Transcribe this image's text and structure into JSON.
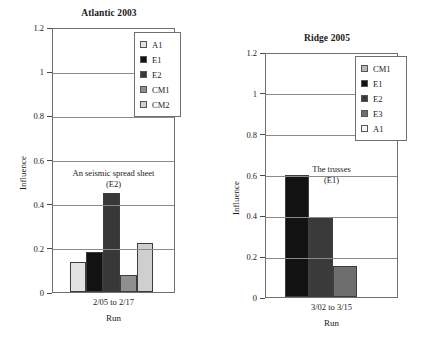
{
  "chart_data": [
    {
      "type": "bar",
      "title": "Atlantic 2003",
      "xlabel": "Run",
      "ylabel": "Influence",
      "categories": [
        "2/05 to 2/17"
      ],
      "ylim": [
        0,
        1.2
      ],
      "yticks": [
        "0",
        "0.2",
        "0.4",
        "0.6",
        "0.8",
        "1",
        "1.2"
      ],
      "ytick_values": [
        0,
        0.2,
        0.4,
        0.6,
        0.8,
        1,
        1.2
      ],
      "grid": true,
      "legend_position": "top-right",
      "series": [
        {
          "name": "A1",
          "values": [
            0.135
          ],
          "color": "#e2e2e2"
        },
        {
          "name": "E1",
          "values": [
            0.18
          ],
          "color": "#121212"
        },
        {
          "name": "E2",
          "values": [
            0.45
          ],
          "color": "#383838"
        },
        {
          "name": "CM1",
          "values": [
            0.075
          ],
          "color": "#8f8f8f"
        },
        {
          "name": "CM2",
          "values": [
            0.22
          ],
          "color": "#cfcfcf"
        }
      ],
      "annotation": {
        "line1": "An seismic spread sheet",
        "line2": "(E2)"
      }
    },
    {
      "type": "bar",
      "title": "Ridge 2005",
      "xlabel": "Run",
      "ylabel": "Influence",
      "categories": [
        "3/02 to 3/15"
      ],
      "ylim": [
        0,
        1.2
      ],
      "yticks": [
        "0",
        "0.2",
        "0.4",
        "0.6",
        "0.8",
        "1",
        "1.2"
      ],
      "ytick_values": [
        0,
        0.2,
        0.4,
        0.6,
        0.8,
        1,
        1.2
      ],
      "grid": true,
      "legend_position": "top-right",
      "series": [
        {
          "name": "CM1",
          "values": [],
          "color": "#b8b8b8"
        },
        {
          "name": "E1",
          "values": [
            0.6
          ],
          "color": "#121212"
        },
        {
          "name": "E2",
          "values": [
            0.39
          ],
          "color": "#3a3a3a"
        },
        {
          "name": "E3",
          "values": [
            0.15
          ],
          "color": "#6e6e6e"
        },
        {
          "name": "A1",
          "values": [],
          "color": "#f4f4f4"
        }
      ],
      "drawn_bars": [
        {
          "name": "E1",
          "value": 0.6,
          "color": "#121212"
        },
        {
          "name": "E2",
          "value": 0.39,
          "color": "#3a3a3a"
        },
        {
          "name": "E3",
          "value": 0.15,
          "color": "#6e6e6e"
        }
      ],
      "annotation": {
        "line1": "The trusses",
        "line2": "(E1)"
      }
    }
  ],
  "left_chart": {
    "title": "Atlantic 2003",
    "ylabel": "Influence",
    "xlabel": "Run",
    "category": "2/05 to 2/17",
    "annotation_line1": "An seismic spread sheet",
    "annotation_line2": "(E2)",
    "yticks": [
      "1.2",
      "1",
      "0.8",
      "0.6",
      "0.4",
      "0.2",
      "0"
    ],
    "legend": [
      {
        "label": "A1"
      },
      {
        "label": "E1"
      },
      {
        "label": "E2"
      },
      {
        "label": "CM1"
      },
      {
        "label": "CM2"
      }
    ]
  },
  "right_chart": {
    "title": "Ridge 2005",
    "ylabel": "Influence",
    "xlabel": "Run",
    "category": "3/02 to 3/15",
    "annotation_line1": "The trusses",
    "annotation_line2": "(E1)",
    "yticks": [
      "1.2",
      "1",
      "0.8",
      "0.6",
      "0.4",
      "0.2",
      "0"
    ],
    "legend": [
      {
        "label": "CM1"
      },
      {
        "label": "E1"
      },
      {
        "label": "E2"
      },
      {
        "label": "E3"
      },
      {
        "label": "A1"
      }
    ]
  }
}
